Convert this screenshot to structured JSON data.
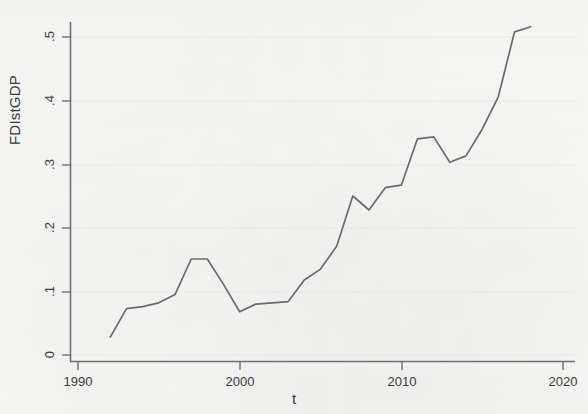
{
  "chart_data": {
    "type": "line",
    "title": "",
    "xlabel": "t",
    "ylabel": "FDIstGDP",
    "xlim": [
      1990,
      2020
    ],
    "ylim": [
      0,
      0.52
    ],
    "xticks": [
      1990,
      2000,
      2010,
      2020
    ],
    "xtick_labels": [
      "1990",
      "2000",
      "2010",
      "2020"
    ],
    "yticks": [
      0,
      0.1,
      0.2,
      0.3,
      0.4,
      0.5
    ],
    "ytick_labels": [
      "0",
      ".1",
      ".2",
      ".3",
      ".4",
      ".5"
    ],
    "grid": "horizontal-faint",
    "legend": "none",
    "line_color": "#6b6b6b",
    "series": [
      {
        "name": "FDIstGDP",
        "x": [
          1992,
          1993,
          1994,
          1995,
          1996,
          1997,
          1998,
          1999,
          2000,
          2001,
          2002,
          2003,
          2004,
          2005,
          2006,
          2007,
          2008,
          2009,
          2010,
          2011,
          2012,
          2013,
          2014,
          2015,
          2016,
          2017,
          2018
        ],
        "values": [
          0.028,
          0.073,
          0.076,
          0.082,
          0.095,
          0.151,
          0.151,
          0.111,
          0.068,
          0.08,
          0.082,
          0.084,
          0.118,
          0.135,
          0.171,
          0.25,
          0.228,
          0.263,
          0.267,
          0.34,
          0.343,
          0.303,
          0.313,
          0.355,
          0.406,
          0.508,
          0.516
        ]
      }
    ]
  },
  "axes": {
    "ylabel_text": "FDIstGDP",
    "xlabel_text": "t"
  }
}
